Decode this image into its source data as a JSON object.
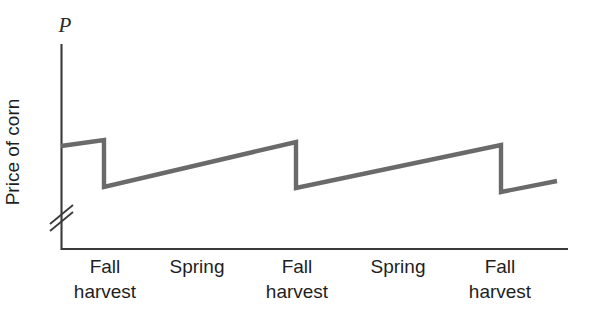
{
  "chart_data": {
    "type": "line",
    "title": "",
    "subtitle": "",
    "ylabel": "Price of corn",
    "y_axis_symbol": "P",
    "xlabel": "",
    "grid": false,
    "legend": null,
    "axis_break": "y-axis break (double slash) near origin",
    "xlim": [
      0,
      100
    ],
    "ylim": [
      0,
      100
    ],
    "x_tick_labels": [
      {
        "line1": "Fall",
        "line2": "harvest",
        "x_px": 105
      },
      {
        "line1": "Spring",
        "line2": "",
        "x_px": 197
      },
      {
        "line1": "Fall",
        "line2": "harvest",
        "x_px": 297
      },
      {
        "line1": "Spring",
        "line2": "",
        "x_px": 398
      },
      {
        "line1": "Fall",
        "line2": "harvest",
        "x_px": 500
      }
    ],
    "series": [
      {
        "name": "Price of corn over the crop year",
        "color": "#6a6a6a",
        "description": "Sawtooth: price rises gradually between harvests, then drops sharply at each fall harvest",
        "points_px": [
          [
            61,
            146
          ],
          [
            104,
            140
          ],
          [
            104,
            187
          ],
          [
            296,
            142
          ],
          [
            296,
            188
          ],
          [
            501,
            145
          ],
          [
            501,
            192
          ],
          [
            557,
            181
          ]
        ]
      }
    ],
    "annotations": []
  },
  "axes": {
    "y_axis_color": "#3a3a3a",
    "x_axis_color": "#3a3a3a",
    "line_color": "#6a6a6a"
  }
}
